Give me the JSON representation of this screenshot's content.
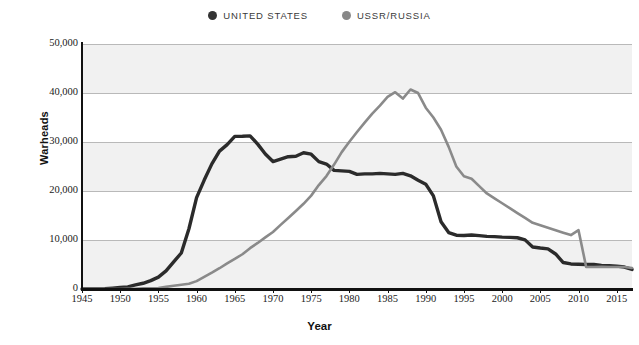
{
  "legend": {
    "position": "top-center",
    "items": [
      {
        "label": "UNITED STATES",
        "color": "#333333",
        "marker": "legend-dot-united-states"
      },
      {
        "label": "USSR/RUSSIA",
        "color": "#888888",
        "marker": "legend-dot-ussr-russia"
      }
    ]
  },
  "axes": {
    "y_title": "Warheads",
    "x_title": "Year",
    "y_ticks": [
      "0",
      "10,000",
      "20,000",
      "30,000",
      "40,000",
      "50,000"
    ],
    "x_ticks": [
      "1945",
      "1950",
      "1955",
      "1960",
      "1965",
      "1970",
      "1975",
      "1980",
      "1985",
      "1990",
      "1995",
      "2000",
      "2005",
      "2010",
      "2015"
    ]
  },
  "chart_data": {
    "type": "line",
    "title": "",
    "subtitle": "",
    "xlabel": "Year",
    "ylabel": "Warheads",
    "xlim": [
      1945,
      2017
    ],
    "ylim": [
      0,
      50000
    ],
    "ytick_values": [
      0,
      10000,
      20000,
      30000,
      40000,
      50000
    ],
    "xtick_values": [
      1945,
      1950,
      1955,
      1960,
      1965,
      1970,
      1975,
      1980,
      1985,
      1990,
      1995,
      2000,
      2005,
      2010,
      2015
    ],
    "grid": "horizontal",
    "legend_position": "top-center",
    "x": [
      1945,
      1946,
      1947,
      1948,
      1949,
      1950,
      1951,
      1952,
      1953,
      1954,
      1955,
      1956,
      1957,
      1958,
      1959,
      1960,
      1961,
      1962,
      1963,
      1964,
      1965,
      1966,
      1967,
      1968,
      1969,
      1970,
      1971,
      1972,
      1973,
      1974,
      1975,
      1976,
      1977,
      1978,
      1979,
      1980,
      1981,
      1982,
      1983,
      1984,
      1985,
      1986,
      1987,
      1988,
      1989,
      1990,
      1991,
      1992,
      1993,
      1994,
      1995,
      1996,
      1997,
      1998,
      1999,
      2000,
      2001,
      2002,
      2003,
      2004,
      2005,
      2006,
      2007,
      2008,
      2009,
      2010,
      2011,
      2012,
      2013,
      2014,
      2015,
      2016,
      2017
    ],
    "series": [
      {
        "name": "UNITED STATES",
        "color": "#2b2b2b",
        "values": [
          2,
          9,
          13,
          50,
          170,
          299,
          438,
          841,
          1169,
          1703,
          2422,
          3692,
          5543,
          7345,
          12298,
          18638,
          22229,
          25540,
          28133,
          29463,
          31139,
          31175,
          31255,
          29561,
          27552,
          26008,
          26516,
          27000,
          27100,
          27800,
          27519,
          26000,
          25500,
          24200,
          24100,
          24000,
          23400,
          23500,
          23500,
          23600,
          23500,
          23400,
          23600,
          23100,
          22200,
          21392,
          19008,
          13708,
          11511,
          10979,
          10904,
          11011,
          10903,
          10732,
          10685,
          10577,
          10526,
          10457,
          10027,
          8570,
          8360,
          8200,
          7150,
          5400,
          5113,
          5066,
          5000,
          5000,
          4804,
          4760,
          4670,
          4480,
          4000
        ]
      },
      {
        "name": "USSR/RUSSIA",
        "color": "#8a8a8a",
        "values": [
          0,
          0,
          0,
          0,
          1,
          5,
          25,
          50,
          120,
          150,
          200,
          426,
          660,
          869,
          1060,
          1605,
          2471,
          3322,
          4238,
          5221,
          6129,
          7089,
          8339,
          9399,
          10538,
          11643,
          13092,
          14478,
          15915,
          17385,
          19055,
          21205,
          23044,
          25393,
          27935,
          30062,
          32049,
          33952,
          35804,
          37431,
          39197,
          40159,
          38859,
          40723,
          39991,
          37000,
          35000,
          32500,
          29000,
          25000,
          23000,
          22500,
          21000,
          19500,
          18500,
          17500,
          16500,
          15500,
          14500,
          13500,
          13000,
          12500,
          12000,
          11500,
          11000,
          12000,
          4500,
          4500,
          4550,
          4500,
          4500,
          4490,
          4300
        ]
      }
    ]
  }
}
